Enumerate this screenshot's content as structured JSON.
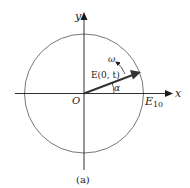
{
  "figure": {
    "caption": "(a)",
    "labels": {
      "y_axis": "y",
      "x_axis": "x",
      "origin": "O",
      "vector": "E(0, t)",
      "angular_velocity": "ω",
      "angle": "α",
      "amplitude_main": "E",
      "amplitude_sub": "10"
    },
    "colors": {
      "stroke": "#1a1a1a",
      "circle": "#555555",
      "background": "#ffffff"
    }
  }
}
